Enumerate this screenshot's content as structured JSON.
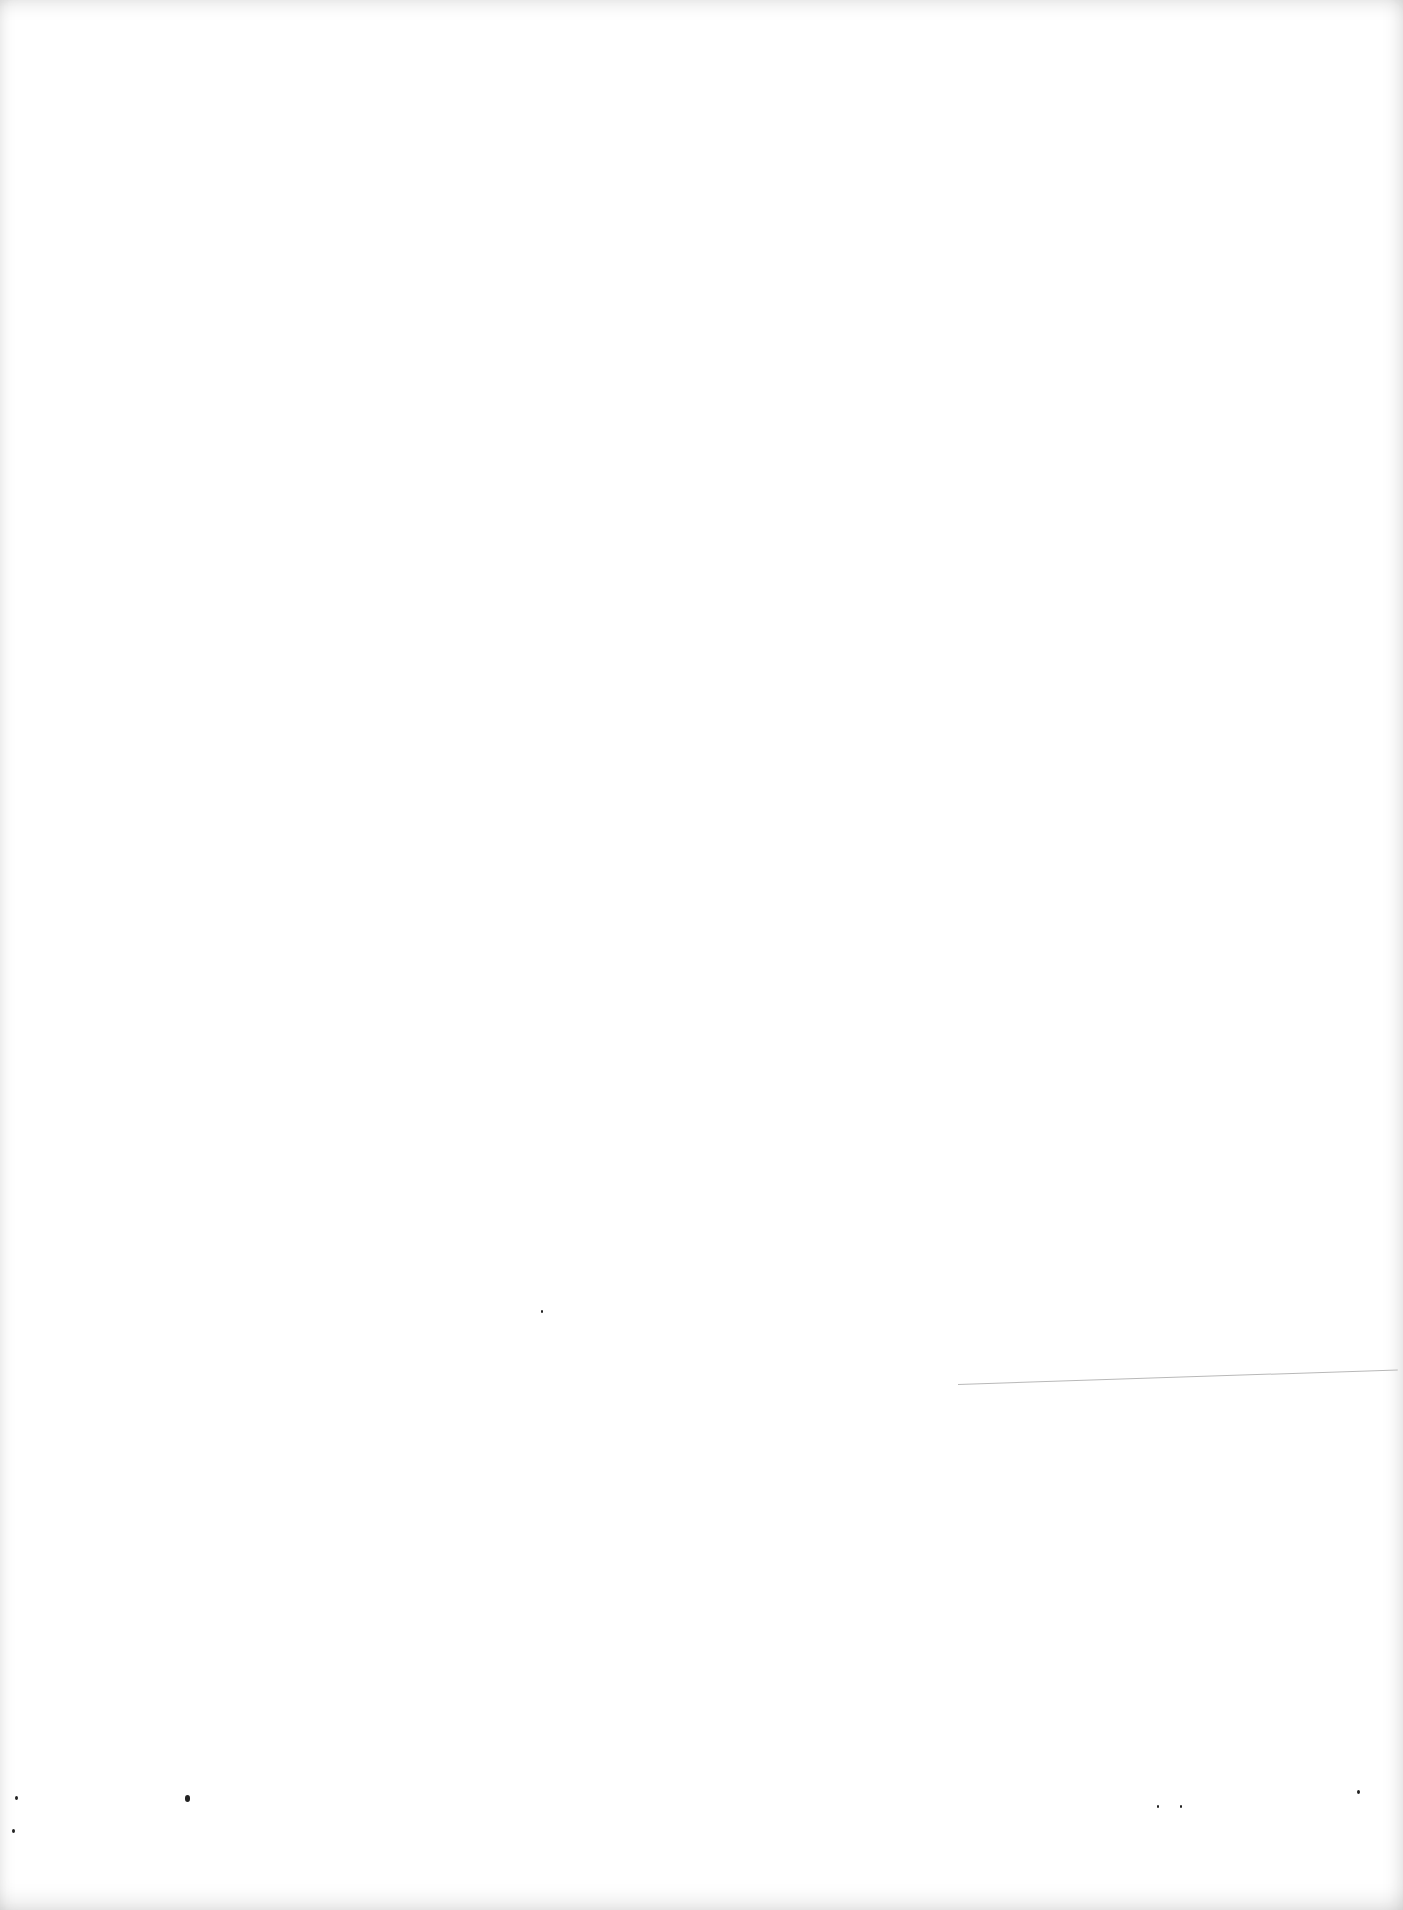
{
  "page": {
    "type": "blank-scanned-page",
    "text_content": [],
    "background_color": "#ffffff",
    "marks": [
      {
        "kind": "line",
        "x1": 958,
        "y1": 1391,
        "x2": 1398,
        "y2": 1372,
        "color": "#b8b8b8"
      },
      {
        "kind": "speck",
        "x": 185,
        "y": 1795,
        "size": 5
      },
      {
        "kind": "speck",
        "x": 15,
        "y": 1796,
        "size": 3
      },
      {
        "kind": "speck",
        "x": 12,
        "y": 1829,
        "size": 3
      },
      {
        "kind": "speck",
        "x": 541,
        "y": 1310,
        "size": 2
      },
      {
        "kind": "speck",
        "x": 1357,
        "y": 1790,
        "size": 3
      },
      {
        "kind": "speck",
        "x": 1157,
        "y": 1805,
        "size": 2
      },
      {
        "kind": "speck",
        "x": 1180,
        "y": 1805,
        "size": 2
      }
    ]
  }
}
